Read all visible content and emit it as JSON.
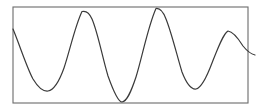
{
  "figure": {
    "title": "",
    "background_color": "#ffffff",
    "width": 263,
    "height": 111
  },
  "frame": {
    "name": "plot-border",
    "x": 13,
    "y": 7,
    "width": 235,
    "height": 96,
    "stroke_color": "#6b6b6b",
    "stroke_width": 1.1,
    "fill_color": "#ffffff"
  },
  "curve": {
    "stroke_color": "#3a3a3a",
    "stroke_width": 1.2,
    "fill": "none",
    "path": "M 13,29 C 20,46 27,68 33,79 C 39,89 44,91.5 48,91 C 54,90 59,82 64,68 C 70,50 75,26 82,11.5 C 86,10.5 89,12 92,19 C 98,33 102,56 108,76 C 113,90 118,102 122,102 C 127,101.5 131,92 136,77 C 142,58 148,26 156,8.5 C 160,8 163,11 166,19 C 172,34 177,56 182,72 C 187,85 192,89.5 196,89 C 201,88 206,79 212,63 C 218,48 223,34 228,31 C 233,31.5 238,38 243,46 C 247,51 251,54 255,55"
  },
  "chart_data": {
    "type": "line",
    "title": "",
    "xlabel": "",
    "ylabel": "",
    "grid": false,
    "legend": null,
    "axis_ticks": [],
    "xlim": [
      0,
      100
    ],
    "ylim": [
      -1,
      1
    ],
    "extrema": [
      {
        "label": "start",
        "kind": "edge",
        "x": 13,
        "y": 29
      },
      {
        "label": "trough-1",
        "kind": "minimum",
        "x": 48,
        "y": 91
      },
      {
        "label": "peak-1",
        "kind": "maximum",
        "x": 82,
        "y": 11
      },
      {
        "label": "trough-2",
        "kind": "minimum",
        "x": 122,
        "y": 102
      },
      {
        "label": "peak-2",
        "kind": "maximum",
        "x": 156,
        "y": 8
      },
      {
        "label": "trough-3",
        "kind": "minimum",
        "x": 196,
        "y": 89
      },
      {
        "label": "peak-3",
        "kind": "maximum",
        "x": 228,
        "y": 31
      },
      {
        "label": "end",
        "kind": "edge",
        "x": 255,
        "y": 55
      }
    ],
    "x": [
      13,
      48,
      82,
      122,
      156,
      196,
      228,
      255
    ],
    "values": [
      0.54,
      -0.75,
      0.92,
      -0.98,
      0.97,
      -0.71,
      0.5,
      0.0
    ],
    "series": [
      {
        "name": "waveform",
        "x": [
          13,
          48,
          82,
          122,
          156,
          196,
          228,
          255
        ],
        "values": [
          0.54,
          -0.75,
          0.92,
          -0.98,
          0.97,
          -0.71,
          0.5,
          0.0
        ]
      }
    ]
  }
}
